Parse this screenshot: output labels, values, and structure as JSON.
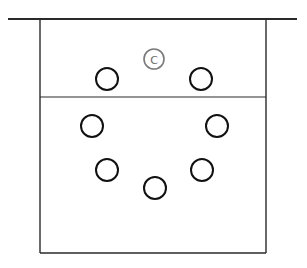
{
  "diagram": {
    "type": "court-formation",
    "coach": {
      "label": "C"
    },
    "players": [
      {
        "id": "p1",
        "label": ""
      },
      {
        "id": "p2",
        "label": ""
      },
      {
        "id": "p3",
        "label": ""
      },
      {
        "id": "p4",
        "label": ""
      },
      {
        "id": "p5",
        "label": ""
      },
      {
        "id": "p6",
        "label": ""
      },
      {
        "id": "p7",
        "label": ""
      }
    ],
    "colors": {
      "player_stroke": "#111111",
      "coach_stroke": "#7a7a7a",
      "line": "#2a2a2a"
    }
  }
}
